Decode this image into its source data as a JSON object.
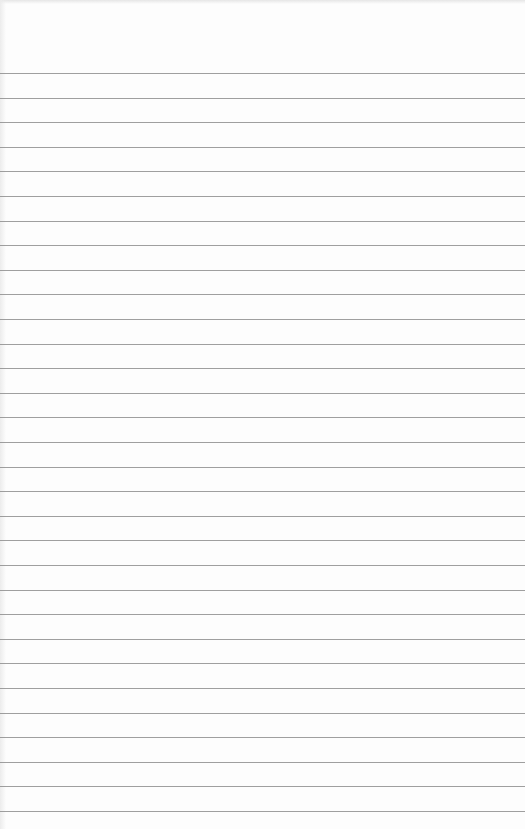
{
  "page": {
    "type": "blank lined paper",
    "background_color": "#fdfdfd",
    "rule_color": "#8e8e8e",
    "rule_count": 31,
    "first_rule_y": 73,
    "rule_spacing_px": 24.6,
    "text": ""
  }
}
